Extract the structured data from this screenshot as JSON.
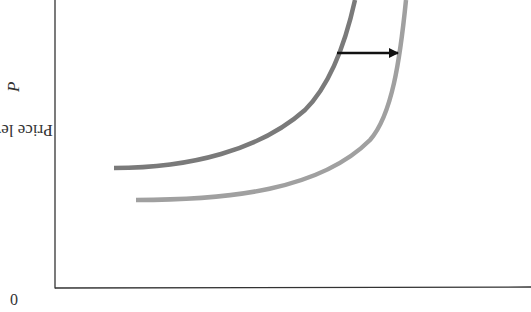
{
  "chart_data": {
    "type": "line",
    "title": "",
    "xlabel": "",
    "ylabel": "Price level, P",
    "ylabel_text": "Price level, ",
    "ylabel_var": "P",
    "origin_label": "0",
    "grid": false,
    "legend": "none",
    "annotations": [
      {
        "type": "arrow",
        "direction": "right",
        "from": [
          337,
          53
        ],
        "to": [
          398,
          53
        ],
        "color": "#111111",
        "meaning": "rightward shift of curve"
      }
    ],
    "series": [
      {
        "name": "original curve",
        "color": "#7a7a7a",
        "path": "M114,168 C190,168 260,150 305,110 C330,85 345,45 355,0"
      },
      {
        "name": "shifted curve",
        "color": "#a0a0a0",
        "path": "M136,200 C230,200 320,190 370,140 C392,115 400,60 406,0"
      }
    ],
    "axes": {
      "x_axis_y": 288,
      "y_axis_x": 55,
      "x_end": 531,
      "y_top": 0
    }
  }
}
